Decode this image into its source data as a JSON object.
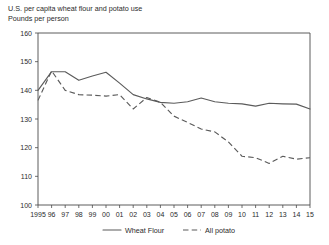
{
  "header": {
    "title": "U.S. per capita wheat flour and potato use",
    "subtitle": "Pounds per person"
  },
  "chart_data": {
    "type": "line",
    "title": "U.S. per capita wheat flour and potato use",
    "subtitle": "Pounds per person",
    "xlabel": "",
    "ylabel": "Pounds per person",
    "ylim": [
      100,
      160
    ],
    "ytick_values": [
      100,
      110,
      120,
      130,
      140,
      150,
      160
    ],
    "ytick_labels": [
      "100",
      "110",
      "120",
      "130",
      "140",
      "150",
      "160"
    ],
    "grid": false,
    "legend_position": "bottom-center",
    "x": [
      1995,
      1996,
      1997,
      1998,
      1999,
      2000,
      2001,
      2002,
      2003,
      2004,
      2005,
      2006,
      2007,
      2008,
      2009,
      2010,
      2011,
      2012,
      2013,
      2014,
      2015
    ],
    "xtick_labels": [
      "1995",
      "96",
      "97",
      "98",
      "99",
      "00",
      "01",
      "02",
      "03",
      "04",
      "05",
      "06",
      "07",
      "08",
      "09",
      "10",
      "11",
      "12",
      "13",
      "14",
      "15"
    ],
    "series": [
      {
        "name": "Wheat Flour",
        "style": "solid",
        "color": "#5b5b5b",
        "values": [
          140.0,
          146.5,
          146.5,
          143.5,
          145.0,
          146.3,
          142.5,
          138.5,
          137.0,
          135.8,
          135.5,
          136.0,
          137.3,
          136.0,
          135.5,
          135.3,
          134.5,
          135.5,
          135.3,
          135.2,
          133.5
        ]
      },
      {
        "name": "All potato",
        "style": "dashed",
        "color": "#5b5b5b",
        "values": [
          136.5,
          146.8,
          140.0,
          138.5,
          138.3,
          138.0,
          138.5,
          133.5,
          137.5,
          135.8,
          131.0,
          128.8,
          126.5,
          125.5,
          122.0,
          117.0,
          116.5,
          114.5,
          117.0,
          116.0,
          116.5
        ]
      }
    ],
    "legend": [
      {
        "label": "Wheat Flour",
        "style": "solid"
      },
      {
        "label": "All potato",
        "style": "dashed"
      }
    ]
  }
}
